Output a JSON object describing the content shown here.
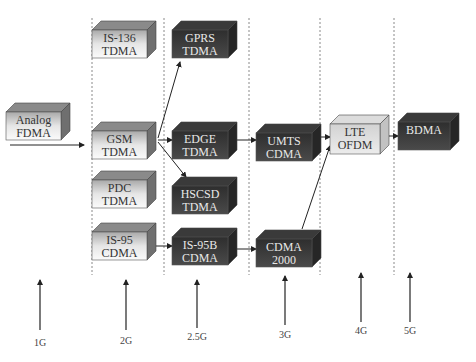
{
  "generations": [
    {
      "id": "1g",
      "label": "1G"
    },
    {
      "id": "2g",
      "label": "2G"
    },
    {
      "id": "2.5g",
      "label": "2.5G"
    },
    {
      "id": "3g",
      "label": "3G"
    },
    {
      "id": "4g",
      "label": "4G"
    },
    {
      "id": "5g",
      "label": "5G"
    }
  ],
  "nodes": [
    {
      "id": "analog",
      "line1": "Analog",
      "line2": "FDMA",
      "generation": "1G",
      "style": "light"
    },
    {
      "id": "is136",
      "line1": "IS-136",
      "line2": "TDMA",
      "generation": "2G",
      "style": "light"
    },
    {
      "id": "gsm",
      "line1": "GSM",
      "line2": "TDMA",
      "generation": "2G",
      "style": "light"
    },
    {
      "id": "pdc",
      "line1": "PDC",
      "line2": "TDMA",
      "generation": "2G",
      "style": "light"
    },
    {
      "id": "is95",
      "line1": "IS-95",
      "line2": "CDMA",
      "generation": "2G",
      "style": "light"
    },
    {
      "id": "gprs",
      "line1": "GPRS",
      "line2": "TDMA",
      "generation": "2.5G",
      "style": "dark"
    },
    {
      "id": "edge",
      "line1": "EDGE",
      "line2": "TDMA",
      "generation": "2.5G",
      "style": "dark"
    },
    {
      "id": "hscsd",
      "line1": "HSCSD",
      "line2": "TDMA",
      "generation": "2.5G",
      "style": "dark"
    },
    {
      "id": "is95b",
      "line1": "IS-95B",
      "line2": "CDMA",
      "generation": "2.5G",
      "style": "dark"
    },
    {
      "id": "umts",
      "line1": "UMTS",
      "line2": "CDMA",
      "generation": "3G",
      "style": "dark"
    },
    {
      "id": "cdma2000",
      "line1": "CDMA",
      "line2": "2000",
      "generation": "3G",
      "style": "dark"
    },
    {
      "id": "lte",
      "line1": "LTE",
      "line2": "OFDM",
      "generation": "4G",
      "style": "light"
    },
    {
      "id": "bdma",
      "line1": "BDMA",
      "line2": "",
      "generation": "5G",
      "style": "dark"
    }
  ],
  "edges": [
    {
      "from": "analog",
      "to": "gsm"
    },
    {
      "from": "gsm",
      "to": "gprs"
    },
    {
      "from": "gsm",
      "to": "edge"
    },
    {
      "from": "gsm",
      "to": "hscsd"
    },
    {
      "from": "edge",
      "to": "umts"
    },
    {
      "from": "is95",
      "to": "is95b"
    },
    {
      "from": "is95b",
      "to": "cdma2000"
    },
    {
      "from": "umts",
      "to": "lte"
    },
    {
      "from": "cdma2000",
      "to": "lte"
    },
    {
      "from": "lte",
      "to": "bdma"
    }
  ]
}
